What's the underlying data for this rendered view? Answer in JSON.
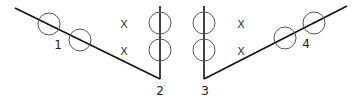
{
  "diagram": {
    "labels": {
      "l1": "1",
      "l2": "2",
      "l3": "3",
      "l4": "4"
    },
    "markers": {
      "x1": "X",
      "x2": "X",
      "x3": "X",
      "x4": "X"
    },
    "colors": {
      "line": "#111111",
      "circle": "#555555"
    }
  }
}
